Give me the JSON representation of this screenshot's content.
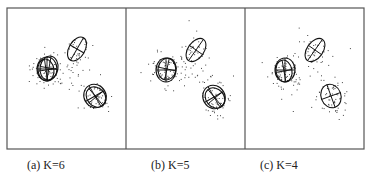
{
  "figure": {
    "frame": {
      "x": 7,
      "y": 8,
      "width": 357,
      "height": 141,
      "stroke": "#555555"
    },
    "dividers": [
      126,
      245
    ],
    "panels": [
      {
        "id": "a",
        "caption": "(a) K=6",
        "caption_x": 27,
        "offset_x": 0,
        "components": [
          {
            "cx": 47,
            "cy": 69,
            "rx": 10,
            "ry": 12,
            "rot": 0
          },
          {
            "cx": 49,
            "cy": 68,
            "rx": 9,
            "ry": 12,
            "rot": 10
          },
          {
            "cx": 46,
            "cy": 70,
            "rx": 8,
            "ry": 11,
            "rot": -8
          },
          {
            "cx": 77,
            "cy": 49,
            "rx": 8,
            "ry": 13,
            "rot": 30
          },
          {
            "cx": 95,
            "cy": 96,
            "rx": 11,
            "ry": 12,
            "rot": -30
          },
          {
            "cx": 96,
            "cy": 97,
            "rx": 9,
            "ry": 11,
            "rot": -40
          }
        ]
      },
      {
        "id": "b",
        "caption": "(b) K=5",
        "caption_x": 151,
        "offset_x": 119,
        "components": [
          {
            "cx": 47,
            "cy": 70,
            "rx": 10,
            "ry": 12,
            "rot": 0
          },
          {
            "cx": 48,
            "cy": 69,
            "rx": 9,
            "ry": 11,
            "rot": 12
          },
          {
            "cx": 77,
            "cy": 50,
            "rx": 8,
            "ry": 13,
            "rot": 35
          },
          {
            "cx": 95,
            "cy": 97,
            "rx": 11,
            "ry": 12,
            "rot": -30
          },
          {
            "cx": 96,
            "cy": 98,
            "rx": 9,
            "ry": 11,
            "rot": -40
          }
        ]
      },
      {
        "id": "c",
        "caption": "(c) K=4",
        "caption_x": 260,
        "offset_x": 238,
        "components": [
          {
            "cx": 47,
            "cy": 70,
            "rx": 10,
            "ry": 12,
            "rot": 0
          },
          {
            "cx": 46,
            "cy": 71,
            "rx": 8,
            "ry": 11,
            "rot": -10
          },
          {
            "cx": 77,
            "cy": 50,
            "rx": 8,
            "ry": 13,
            "rot": 35
          },
          {
            "cx": 93,
            "cy": 96,
            "rx": 10,
            "ry": 12,
            "rot": -20
          }
        ]
      }
    ],
    "clusters": [
      {
        "cx": 47,
        "cy": 70,
        "sx": 11,
        "sy": 11,
        "n": 70
      },
      {
        "cx": 77,
        "cy": 50,
        "sx": 9,
        "sy": 11,
        "n": 35
      },
      {
        "cx": 96,
        "cy": 98,
        "sx": 10,
        "sy": 11,
        "n": 55
      },
      {
        "cx": 70,
        "cy": 75,
        "sx": 22,
        "sy": 20,
        "n": 20
      }
    ]
  }
}
